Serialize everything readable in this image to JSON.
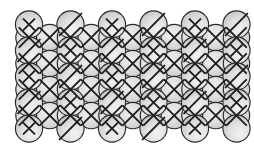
{
  "figure": {
    "width": 254,
    "height": 154,
    "background_color": "#ffffff"
  },
  "style": {
    "circle_fill_light": "#ececed",
    "circle_fill_mid": "#d8d8d9",
    "circle_fill_dark": "#bcbcbe",
    "circle_stroke_color": "#2a2a2a",
    "mark_stroke_color": "#1f1f1f",
    "circle_radius": 13.6,
    "interstitial_radius": 13.2
  },
  "lattice": {
    "main_rows": 5,
    "main_columns": 6,
    "column_spacing": 41.5,
    "row_spacing": 26.0,
    "origin_x": 29.0,
    "origin_y": 24.5,
    "interstitial_rows": 4,
    "interstitial_columns": 11,
    "interstitial_origin_x": 29.0,
    "interstitial_spacing_x": 20.75,
    "interstitial_origin_y": 37.5
  },
  "marks": {
    "cross_label": "cross",
    "slash_label": "slash",
    "blank_label": "blank",
    "main_grid": [
      [
        "cross",
        "slash",
        "cross",
        "slash",
        "cross",
        "slash"
      ],
      [
        "slash",
        "cross",
        "slash",
        "cross",
        "slash",
        "cross"
      ],
      [
        "cross",
        "slash",
        "cross",
        "slash",
        "cross",
        "slash"
      ],
      [
        "slash",
        "cross",
        "slash",
        "cross",
        "slash",
        "cross"
      ],
      [
        "cross",
        "slash",
        "cross",
        "slash",
        "cross",
        "blank"
      ]
    ],
    "interstitial_grid": [
      [
        "cross",
        "cross",
        "cross",
        "cross",
        "cross",
        "cross",
        "cross",
        "cross",
        "cross",
        "cross",
        "cross"
      ],
      [
        "cross",
        "cross",
        "cross",
        "cross",
        "cross",
        "cross",
        "cross",
        "cross",
        "cross",
        "cross",
        "cross"
      ],
      [
        "cross",
        "cross",
        "cross",
        "cross",
        "cross",
        "cross",
        "cross",
        "cross",
        "cross",
        "cross",
        "cross"
      ],
      [
        "cross",
        "cross",
        "cross",
        "cross",
        "cross",
        "cross",
        "cross",
        "cross",
        "cross",
        "cross",
        "cross"
      ]
    ]
  }
}
